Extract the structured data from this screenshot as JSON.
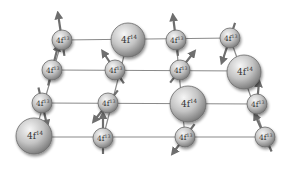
{
  "diagram": {
    "title": "",
    "colors": {
      "background": "#ffffff",
      "lattice_line": "#8a8a8a",
      "atom_fill_light": "#e8e8e8",
      "atom_fill_dark": "#8c8c8c",
      "atom_stroke": "#6a6a6a",
      "arrow": "#6e6e6e",
      "label": "#333333"
    },
    "lattice_rows": [
      {
        "x1": 62,
        "y1": 40,
        "x2": 232,
        "y2": 38
      },
      {
        "x1": 52,
        "y1": 70,
        "x2": 246,
        "y2": 71
      },
      {
        "x1": 42,
        "y1": 103,
        "x2": 258,
        "y2": 104
      },
      {
        "x1": 34,
        "y1": 137,
        "x2": 266,
        "y2": 137
      }
    ],
    "lattice_columns": [
      {
        "x1": 62,
        "y1": 40,
        "x2": 34,
        "y2": 137
      },
      {
        "x1": 128,
        "y1": 40,
        "x2": 103,
        "y2": 138
      },
      {
        "x1": 176,
        "y1": 40,
        "x2": 185,
        "y2": 137
      },
      {
        "x1": 230,
        "y1": 38,
        "x2": 265,
        "y2": 137
      }
    ],
    "ions": [
      {
        "id": "r1c1",
        "label": "4f",
        "sup": "13",
        "x": 62,
        "y": 40,
        "r": 10,
        "spin": {
          "dx": -4,
          "dy": -26
        }
      },
      {
        "id": "r1c2",
        "label": "4f",
        "sup": "14",
        "x": 128,
        "y": 40,
        "r": 17,
        "spin": null
      },
      {
        "id": "r1c3",
        "label": "4f",
        "sup": "13",
        "x": 176,
        "y": 40,
        "r": 10,
        "spin": {
          "dx": -3,
          "dy": -24
        }
      },
      {
        "id": "r1c4",
        "label": "4f",
        "sup": "13",
        "x": 230,
        "y": 38,
        "r": 10,
        "spin": {
          "dx": -8,
          "dy": 24
        }
      },
      {
        "id": "r2c1",
        "label": "4f",
        "sup": "13",
        "x": 52,
        "y": 70,
        "r": 10,
        "spin": {
          "dx": 6,
          "dy": -24
        }
      },
      {
        "id": "r2c2",
        "label": "4f",
        "sup": "13",
        "x": 115,
        "y": 70,
        "r": 10,
        "spin": {
          "dx": -12,
          "dy": -18
        }
      },
      {
        "id": "r2c3",
        "label": "4f",
        "sup": "13",
        "x": 180,
        "y": 70,
        "r": 10,
        "spin": {
          "dx": 14,
          "dy": -18
        }
      },
      {
        "id": "r2c4",
        "label": "4f",
        "sup": "14",
        "x": 244,
        "y": 72,
        "r": 17,
        "spin": null
      },
      {
        "id": "r3c1",
        "label": "4f",
        "sup": "13",
        "x": 42,
        "y": 103,
        "r": 10,
        "spin": {
          "dx": 5,
          "dy": 22
        }
      },
      {
        "id": "r3c2",
        "label": "4f",
        "sup": "13",
        "x": 108,
        "y": 103,
        "r": 10,
        "spin": {
          "dx": -14,
          "dy": 18
        }
      },
      {
        "id": "r3c3",
        "label": "4f",
        "sup": "14",
        "x": 188,
        "y": 104,
        "r": 18,
        "spin": null
      },
      {
        "id": "r3c4",
        "label": "4f",
        "sup": "13",
        "x": 257,
        "y": 104,
        "r": 10,
        "spin": {
          "dx": 2,
          "dy": -22
        }
      },
      {
        "id": "r4c1",
        "label": "4f",
        "sup": "14",
        "x": 34,
        "y": 136,
        "r": 18,
        "spin": null
      },
      {
        "id": "r4c2",
        "label": "4f",
        "sup": "13",
        "x": 103,
        "y": 138,
        "r": 10,
        "spin": {
          "dx": 0,
          "dy": -24
        }
      },
      {
        "id": "r4c3",
        "label": "4f",
        "sup": "13",
        "x": 185,
        "y": 137,
        "r": 10,
        "spin": {
          "dx": -12,
          "dy": 16
        }
      },
      {
        "id": "r4c4",
        "label": "4f",
        "sup": "13",
        "x": 265,
        "y": 137,
        "r": 10,
        "spin": {
          "dx": -10,
          "dy": -22
        }
      }
    ]
  }
}
